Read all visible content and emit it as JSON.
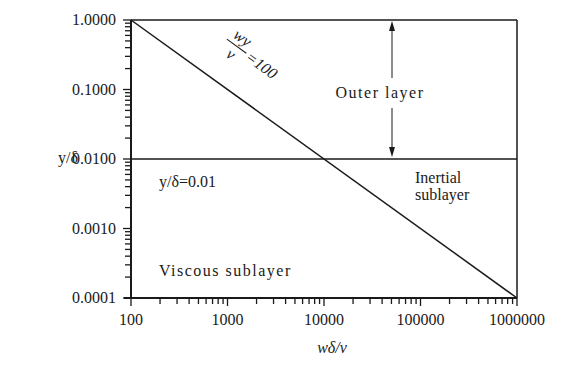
{
  "chart_data": {
    "type": "line",
    "title": "",
    "xlabel": "wδ/ν",
    "ylabel": "y/δ",
    "xscale": "log",
    "yscale": "log",
    "xlim": [
      100,
      1000000
    ],
    "ylim": [
      0.0001,
      1.0
    ],
    "x_tick_labels": [
      "100",
      "1000",
      "10000",
      "100000",
      "1000000"
    ],
    "y_tick_labels": [
      "1.0000",
      "0.1000",
      "0.0100",
      "0.0010",
      "0.0001"
    ],
    "grid": false,
    "legend": null,
    "series": [
      {
        "name": "wy/ν = 100",
        "x": [
          100,
          1000,
          10000,
          100000,
          1000000
        ],
        "y": [
          1.0,
          0.1,
          0.01,
          0.001,
          0.0001
        ]
      },
      {
        "name": "y/δ = 0.01",
        "x": [
          100,
          1000000
        ],
        "y": [
          0.01,
          0.01
        ]
      }
    ],
    "annotations": [
      {
        "text": "wy/ν = 100",
        "type": "rotated-line-label"
      },
      {
        "text": "Outer layer",
        "type": "region",
        "with_double_arrow": true,
        "arrow_span_y": [
          0.01,
          1.0
        ],
        "arrow_x": 30000
      },
      {
        "text": "y/δ=0.01",
        "type": "line-label"
      },
      {
        "text": "Inertial sublayer",
        "type": "region"
      },
      {
        "text": "Viscous sublayer",
        "type": "region"
      }
    ]
  },
  "axes": {
    "x_title_italic": "wδ/ν",
    "y_title": "y/δ",
    "x_ticks": [
      "100",
      "1000",
      "10000",
      "100000",
      "1000000"
    ],
    "y_ticks": [
      "1.0000",
      "0.1000",
      "0.0100",
      "0.0010",
      "0.0001"
    ]
  },
  "labels": {
    "line_fraction_num": "wy",
    "line_fraction_den": "ν",
    "line_fraction_eq": "=100",
    "outer_layer": "Outer layer",
    "hline_label": "y/δ=0.01",
    "inertial_line1": "Inertial",
    "inertial_line2": "sublayer",
    "viscous": "Viscous sublayer"
  },
  "colors": {
    "line": "#1a1a1a",
    "background": "#ffffff"
  }
}
